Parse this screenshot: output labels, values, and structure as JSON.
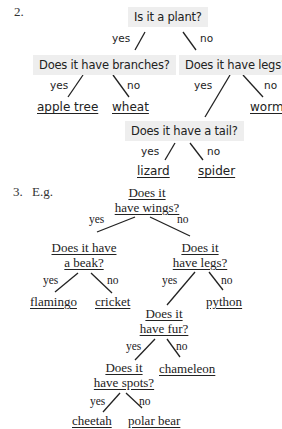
{
  "section2": {
    "number": "2.",
    "root": "Is it a plant?",
    "yes": "yes",
    "no": "no",
    "branches_q": "Does it have branches?",
    "legs_q": "Does it have legs?",
    "tail_q": "Does it have a tail?",
    "leaves": {
      "apple_tree": "apple tree",
      "wheat": "wheat",
      "worm": "worm",
      "lizard": "lizard",
      "spider": "spider"
    }
  },
  "section3": {
    "number": "3.",
    "prefix": "E.g.",
    "yes": "yes",
    "no": "no",
    "wings_q": [
      "Does it",
      "have wings?"
    ],
    "beak_q": [
      "Does it have",
      "a beak?"
    ],
    "legs_q": [
      "Does it",
      "have legs?"
    ],
    "fur_q": [
      "Does it",
      "have fur?"
    ],
    "spots_q": [
      "Does it",
      "have spots?"
    ],
    "leaves": {
      "flamingo": "flamingo",
      "cricket": "cricket",
      "python": "python",
      "chameleon": "chameleon",
      "cheetah": "cheetah",
      "polar_bear": "polar bear"
    }
  }
}
